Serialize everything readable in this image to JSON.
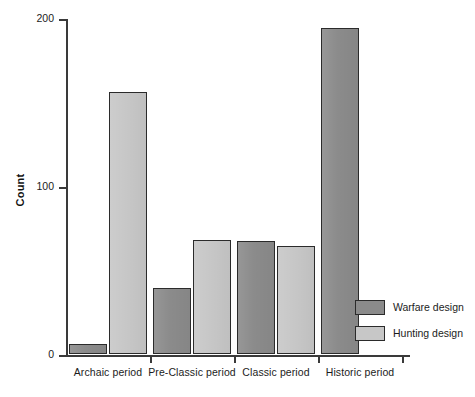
{
  "chart_data": {
    "type": "bar",
    "title": "",
    "xlabel": "",
    "ylabel": "Count",
    "categories": [
      "Archaic period",
      "Pre-Classic period",
      "Classic period",
      "Historic period"
    ],
    "series": [
      {
        "name": "Warfare design",
        "color": "#8b8b8b",
        "values": [
          6,
          39,
          67,
          194
        ]
      },
      {
        "name": "Hunting design",
        "color": "#c7c7c7",
        "values": [
          156,
          68,
          64,
          null
        ]
      }
    ],
    "ylim": [
      0,
      200
    ],
    "yticks": [
      0,
      100,
      200
    ],
    "ytick_labels": [
      "0",
      "100",
      "200"
    ],
    "grid": false,
    "legend_position": "bottom-right",
    "axis_color": "#3a3a3a",
    "bar_edge_color": "#2b2b2b"
  },
  "axes": {
    "y_title": "Count",
    "y_tick_labels": [
      "200",
      "100",
      "0"
    ],
    "y_tick_values": [
      200,
      100,
      0
    ]
  },
  "legend": {
    "items": [
      {
        "label": "Warfare design",
        "color": "#8b8b8b"
      },
      {
        "label": "Hunting design",
        "color": "#c7c7c7"
      }
    ]
  }
}
